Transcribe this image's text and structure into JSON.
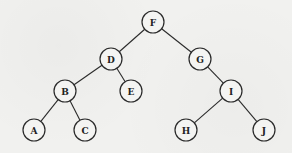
{
  "diagram": {
    "type": "binary-tree",
    "node_radius": 11,
    "colors": {
      "background": "#f1f1ef",
      "stroke": "#2a2a2a",
      "node_fill": "#f4f4f2",
      "text": "#222222"
    },
    "nodes": [
      {
        "id": "F",
        "label": "F",
        "x": 153,
        "y": 22
      },
      {
        "id": "D",
        "label": "D",
        "x": 111,
        "y": 59
      },
      {
        "id": "G",
        "label": "G",
        "x": 200,
        "y": 59
      },
      {
        "id": "B",
        "label": "B",
        "x": 65,
        "y": 91
      },
      {
        "id": "E",
        "label": "E",
        "x": 131,
        "y": 91
      },
      {
        "id": "I",
        "label": "I",
        "x": 231,
        "y": 91
      },
      {
        "id": "A",
        "label": "A",
        "x": 34,
        "y": 130
      },
      {
        "id": "C",
        "label": "C",
        "x": 85,
        "y": 130
      },
      {
        "id": "H",
        "label": "H",
        "x": 186,
        "y": 130
      },
      {
        "id": "J",
        "label": "J",
        "x": 264,
        "y": 130
      }
    ],
    "edges": [
      {
        "from": "F",
        "to": "D"
      },
      {
        "from": "F",
        "to": "G"
      },
      {
        "from": "D",
        "to": "B"
      },
      {
        "from": "D",
        "to": "E"
      },
      {
        "from": "G",
        "to": "I"
      },
      {
        "from": "B",
        "to": "A"
      },
      {
        "from": "B",
        "to": "C"
      },
      {
        "from": "I",
        "to": "H"
      },
      {
        "from": "I",
        "to": "J"
      }
    ]
  }
}
